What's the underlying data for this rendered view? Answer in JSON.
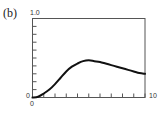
{
  "panel_label": "(b)",
  "axes": {
    "y_top_label": "1.0",
    "y_bottom_label": "0",
    "x_left_label": "0",
    "x_right_label": "10"
  },
  "chart_data": {
    "type": "line",
    "title": "",
    "panel": "(b)",
    "xlabel": "",
    "ylabel": "",
    "xlim": [
      0,
      10
    ],
    "ylim": [
      0,
      1.0
    ],
    "x_ticks": [
      0,
      1,
      2,
      3,
      4,
      5,
      6,
      7,
      8,
      9,
      10
    ],
    "y_ticks": [
      0,
      0.1,
      0.2,
      0.3,
      0.4,
      0.5,
      0.6,
      0.7,
      0.8,
      0.9,
      1.0
    ],
    "tick_labels": {
      "x": [
        "0",
        "10"
      ],
      "y": [
        "0",
        "1.0"
      ]
    },
    "grid": false,
    "legend": null,
    "series": [
      {
        "name": "curve",
        "color": "#111111",
        "x": [
          0,
          0.5,
          1,
          1.5,
          2,
          2.5,
          3,
          3.5,
          4,
          4.5,
          5,
          5.5,
          6,
          6.5,
          7,
          7.5,
          8,
          8.5,
          9,
          9.5,
          10
        ],
        "y": [
          0,
          0.01,
          0.05,
          0.1,
          0.17,
          0.25,
          0.33,
          0.39,
          0.43,
          0.46,
          0.47,
          0.46,
          0.45,
          0.43,
          0.41,
          0.39,
          0.37,
          0.35,
          0.33,
          0.31,
          0.3
        ]
      }
    ]
  }
}
